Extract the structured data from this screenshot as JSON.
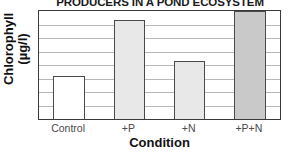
{
  "chart_data": {
    "type": "bar",
    "title": "PRODUCERS IN A POND ECOSYSTEM",
    "xlabel": "Condition",
    "ylabel_line1": "Chlorophyll",
    "ylabel_line2": "(µg/l)",
    "ylabel": "Chlorophyll (µg/l)",
    "categories": [
      "Control",
      "+P",
      "+N",
      "+P+N"
    ],
    "values": [
      3.2,
      7.3,
      4.3,
      8.0
    ],
    "ylim": [
      0,
      8
    ],
    "y_tick_values": [
      0,
      1,
      2,
      3,
      4,
      5,
      6,
      7,
      8
    ],
    "y_tick_labels_shown": false,
    "grid": true,
    "grid_orientation": "horizontal",
    "gridline_count": 7,
    "legend": null,
    "bars": [
      {
        "category": "Control",
        "value": 3.2,
        "fill": "#ffffff",
        "border": "#4a4a4a"
      },
      {
        "category": "+P",
        "value": 7.3,
        "fill": "#e8e8e8",
        "border": "#4a4a4a"
      },
      {
        "category": "+N",
        "value": 4.3,
        "fill": "#e8e8e8",
        "border": "#4a4a4a"
      },
      {
        "category": "+P+N",
        "value": 8.0,
        "fill": "#c9c9c9",
        "border": "#4a4a4a"
      }
    ]
  },
  "colors": {
    "frame": "#3a3a3a",
    "gridline": "#b8b8b8",
    "title_text": "#1a1a1a",
    "axis_title_text": "#111111",
    "tick_text": "#4a4a4a",
    "background": "#ffffff"
  }
}
